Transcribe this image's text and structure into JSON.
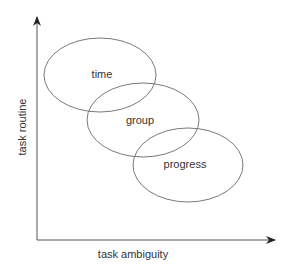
{
  "diagram": {
    "axes": {
      "x_label": "task ambiguity",
      "y_label": "task routine"
    },
    "ellipses": [
      {
        "label": "time",
        "cx": 100,
        "cy": 75,
        "rx": 56,
        "ry": 37
      },
      {
        "label": "group",
        "cx": 143,
        "cy": 120,
        "rx": 56,
        "ry": 37
      },
      {
        "label": "progress",
        "cx": 188,
        "cy": 165,
        "rx": 55,
        "ry": 37
      }
    ],
    "colors": {
      "stroke": "#666666",
      "axis": "#444444",
      "text": "#333333"
    }
  }
}
